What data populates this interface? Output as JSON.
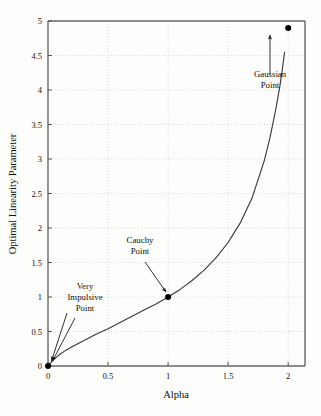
{
  "chart_data": {
    "type": "line",
    "title": "",
    "xlabel": "Alpha",
    "ylabel": "Optimal Linearity Parameter",
    "xlim": [
      0,
      2.14
    ],
    "ylim": [
      0,
      5
    ],
    "grid": true,
    "legend": "none",
    "xticks": [
      "0",
      "0.5",
      "1",
      "1.5",
      "2"
    ],
    "xtick_values": [
      0,
      0.5,
      1,
      1.5,
      2
    ],
    "yticks": [
      "0",
      "0.5",
      "1",
      "1.5",
      "2",
      "2.5",
      "3",
      "3.5",
      "4",
      "4.5",
      "5"
    ],
    "ytick_values": [
      0,
      0.5,
      1,
      1.5,
      2,
      2.5,
      3,
      3.5,
      4,
      4.5,
      5
    ],
    "series": [
      {
        "name": "Optimal Linearity Parameter vs Alpha",
        "x": [
          0.0,
          0.05,
          0.1,
          0.15,
          0.2,
          0.3,
          0.4,
          0.5,
          0.6,
          0.7,
          0.8,
          0.9,
          1.0,
          1.1,
          1.2,
          1.3,
          1.4,
          1.5,
          1.6,
          1.7,
          1.8,
          1.85,
          1.9,
          1.93,
          1.95,
          1.97
        ],
        "y": [
          0.0,
          0.1,
          0.17,
          0.23,
          0.28,
          0.37,
          0.46,
          0.54,
          0.63,
          0.72,
          0.81,
          0.9,
          1.0,
          1.11,
          1.24,
          1.39,
          1.57,
          1.79,
          2.07,
          2.44,
          2.97,
          3.32,
          3.75,
          4.05,
          4.28,
          4.55
        ],
        "color": "#3a3a3a"
      }
    ],
    "points": [
      {
        "label": "Very Impulsive Point",
        "x": 0.0,
        "y": 0.0,
        "marker": "filled-circle"
      },
      {
        "label": "Cauchy Point",
        "x": 1.0,
        "y": 1.0,
        "marker": "filled-circle"
      },
      {
        "label": "Gaussian Point",
        "x": 2.0,
        "y": 4.9,
        "marker": "filled-circle"
      }
    ],
    "annotations": [
      {
        "name": "very-impulsive-point",
        "lines": [
          "Very",
          "Impulsive",
          "Point"
        ],
        "target_x": 0.0,
        "target_y": 0.0,
        "arrow": "down-left"
      },
      {
        "name": "cauchy-point",
        "lines": [
          "Cauchy",
          "Point"
        ],
        "target_x": 1.0,
        "target_y": 1.0,
        "arrow": "down-right"
      },
      {
        "name": "gaussian-point",
        "lines": [
          "Gaussian",
          "Point"
        ],
        "target_x": 2.0,
        "target_y": 4.9,
        "arrow": "up"
      }
    ],
    "colors": {
      "background": "#fdfdfc",
      "axis": "#555555",
      "grid": "#c9c9c9",
      "curve": "#3a3a3a",
      "marker": "#000000",
      "text": "#111111"
    }
  }
}
